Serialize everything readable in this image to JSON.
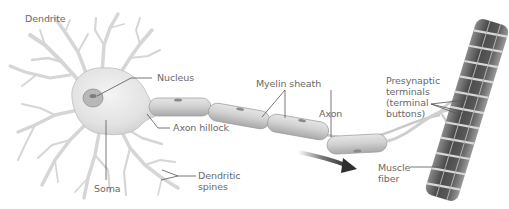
{
  "diagram": {
    "labels": {
      "dendrite": "Dendrite",
      "nucleus": "Nucleus",
      "axon_hillock": "Axon hillock",
      "soma": "Soma",
      "dendritic_spines": "Dendritic\nspines",
      "myelin_sheath": "Myelin sheath",
      "axon": "Axon",
      "presynaptic_terminals": "Presynaptic\nterminals\n(terminal\nbuttons)",
      "muscle_fiber": "Muscle\nfiber"
    },
    "components": [
      {
        "id": "dendrite",
        "label": "Dendrite"
      },
      {
        "id": "soma",
        "label": "Soma"
      },
      {
        "id": "nucleus",
        "label": "Nucleus"
      },
      {
        "id": "axon_hillock",
        "label": "Axon hillock"
      },
      {
        "id": "dendritic_spines",
        "label": "Dendritic spines"
      },
      {
        "id": "myelin_sheath",
        "label": "Myelin sheath",
        "segments": 5
      },
      {
        "id": "axon",
        "label": "Axon"
      },
      {
        "id": "presynaptic_terminals",
        "label": "Presynaptic terminals (terminal buttons)"
      },
      {
        "id": "muscle_fiber",
        "label": "Muscle fiber"
      }
    ],
    "annotations": {
      "signal_direction_arrow": "arrow pointing right-down along axon, indicating direction of impulse"
    },
    "colors": {
      "background": "#ffffff",
      "label_text": "#6a6a6a",
      "leader_line": "#555555",
      "cell_body": "#e4e4e4",
      "myelin": "#cfcfcf",
      "muscle_dark": "#4a4a4a",
      "muscle_stripe": "#d8d8d8",
      "arrow": "#3a3a3a"
    }
  }
}
